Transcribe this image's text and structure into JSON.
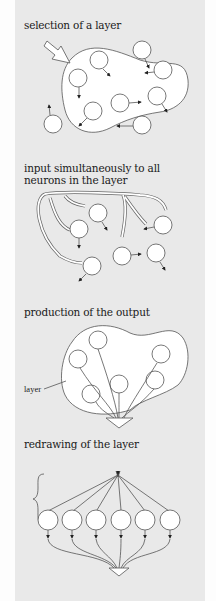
{
  "figure": {
    "panels": [
      {
        "caption": "selection of a layer"
      },
      {
        "caption_line1": "input simultaneously to all",
        "caption_line2": "neurons in the layer"
      },
      {
        "caption": "production of the output",
        "label": "layer"
      },
      {
        "caption": "redrawing of the layer"
      }
    ],
    "colors": {
      "background": "#e9e9e9",
      "margin": "#fdfdfd",
      "stroke": "#444444",
      "node_fill": "#ffffff"
    }
  }
}
